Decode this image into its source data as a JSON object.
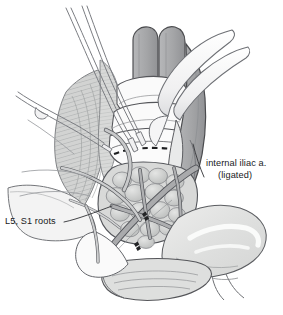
{
  "figure": {
    "kind": "surgical-anatomical-illustration",
    "width": 283,
    "height": 315,
    "background_color": "#ffffff"
  },
  "labels": {
    "internal_iliac": {
      "line1": "internal iliac a.",
      "line2": "(ligated)",
      "leader_from": [
        205,
        176
      ],
      "leader_to": [
        193,
        144
      ]
    },
    "l5_s1": {
      "text": "L5, S1 roots",
      "leader_from": [
        64,
        222
      ],
      "leader_to": [
        112,
        207
      ]
    }
  },
  "palette": {
    "outline": "#3f4043",
    "outline_light": "#6f7176",
    "hairline": "#8b8d92",
    "vessel_fill": "#a8a9ab",
    "vessel_fill_dark": "#96979a",
    "vessel_fill_light": "#c2c3c5",
    "muscle_fill": "#cfd0cf",
    "muscle_stripe": "#9fa1a2",
    "tumor_fill": "#d6d7d6",
    "tumor_node": "#c3c5c4",
    "bowel_fill": "#e3e4e3",
    "bowel_highlight": "#f4f5f4",
    "instrument_fill": "#fbfbfb",
    "instrument_edge": "#7d7f84",
    "dash_mark": "#1d1e20",
    "clip_mark": "#232426",
    "text": "#19191b"
  },
  "structures": [
    {
      "name": "aorta-left-trunk",
      "role": "great vessel trunk, upper center"
    },
    {
      "name": "aorta-right-trunk",
      "role": "great vessel trunk, upper center"
    },
    {
      "name": "common-iliac-vessel-right",
      "role": "descending right vessel"
    },
    {
      "name": "internal-iliac-artery",
      "role": "ligated artery stump"
    },
    {
      "name": "psoas-muscle-striated",
      "role": "striated muscle belly, left"
    },
    {
      "name": "lumbosacral-nerve-roots",
      "role": "L5 and S1 nerve roots"
    },
    {
      "name": "tumor-nodular-mass",
      "role": "lobulated nodular mass in pelvis"
    },
    {
      "name": "rectum-bowel-loop",
      "role": "pale bowel / rectum, lower right"
    },
    {
      "name": "sacral-promontory-ellipse",
      "role": "lens-shaped cut surface, bottom"
    },
    {
      "name": "resection-dashed-line",
      "role": "dashed transection line"
    },
    {
      "name": "vascular-clip",
      "role": "small dark ligature clip"
    },
    {
      "name": "retractor-curved-right",
      "role": "curved retractor blade, upper right"
    },
    {
      "name": "forceps-upper-left",
      "role": "fine forceps tips, upper left"
    },
    {
      "name": "probe-lower-left",
      "role": "slender probe, left"
    }
  ]
}
